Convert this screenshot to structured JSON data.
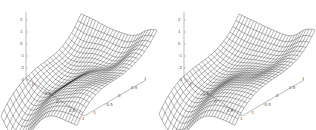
{
  "chart_data": [
    {
      "type": "surface",
      "title": "",
      "xlabel": "",
      "ylabel": "",
      "zlabel": "",
      "x_ticks": [
        "-1",
        "-0.5",
        "0",
        "0.5",
        "1"
      ],
      "y_ticks": [
        "-1",
        "-0.5",
        "0",
        "0.5",
        "1"
      ],
      "z_ticks": [
        "-2",
        "-1",
        "0",
        "1",
        "2"
      ],
      "xlim": [
        -1,
        1
      ],
      "ylim": [
        -1,
        1
      ],
      "zlim": [
        -2,
        2.5
      ],
      "grid": false,
      "description": "Wireframe surface with a saddle-like shape: high ridge at back, curling edge at right, deep dip toward front-left; mesh shows denser/darker shading indicating more oscillation"
    },
    {
      "type": "surface",
      "title": "",
      "xlabel": "",
      "ylabel": "",
      "zlabel": "",
      "x_ticks": [
        "-1",
        "-0.5",
        "0",
        "0.5",
        "1"
      ],
      "y_ticks": [
        "-1",
        "-0.5",
        "0",
        "0.5",
        "1"
      ],
      "z_ticks": [
        "-2",
        "-1",
        "0",
        "1",
        "2"
      ],
      "xlim": [
        -1,
        1
      ],
      "ylim": [
        -1,
        1
      ],
      "zlim": [
        -2,
        2.5
      ],
      "grid": false,
      "description": "Smoother wireframe surface with similar overall saddle shape: high at back, curling right edge, lower toward front"
    }
  ],
  "plots": {
    "left": {
      "z_labels": [
        "2",
        "1",
        "0",
        "-1",
        "-2",
        "-3"
      ],
      "x_labels": [
        "-1",
        "-0.5",
        "0",
        "0.5",
        "1"
      ],
      "y_labels": [
        "-1",
        "-0.5",
        "0",
        "0.5",
        "1"
      ]
    },
    "right": {
      "z_labels": [
        "2",
        "1",
        "0",
        "-1",
        "-2",
        "-3"
      ],
      "x_labels": [
        "-1",
        "-0.5",
        "0",
        "0.5",
        "1"
      ],
      "y_labels": [
        "-1",
        "-0.5",
        "0",
        "0.5",
        "1"
      ]
    }
  },
  "colors": {
    "mesh": "#222222",
    "axis": "#777777",
    "background": "#ffffff"
  }
}
